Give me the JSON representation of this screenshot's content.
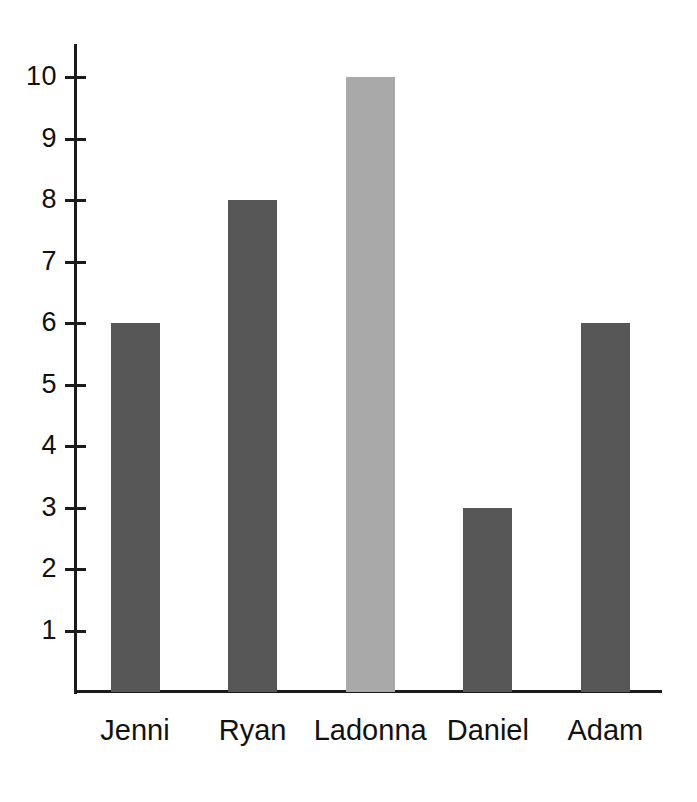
{
  "chart_data": {
    "type": "bar",
    "title": "",
    "subtitle": "",
    "xlabel": "",
    "ylabel": "",
    "categories": [
      "Jenni",
      "Ryan",
      "Ladonna",
      "Daniel",
      "Adam"
    ],
    "values": [
      6,
      8,
      10,
      3,
      6
    ],
    "series": [
      {
        "name": "",
        "values": [
          6,
          8,
          10,
          3,
          6
        ]
      }
    ],
    "bars": [
      {
        "category": "Jenni",
        "value": 6,
        "color": "#575757"
      },
      {
        "category": "Ryan",
        "value": 8,
        "color": "#575757"
      },
      {
        "category": "Ladonna",
        "value": 10,
        "color": "#a9a9a9"
      },
      {
        "category": "Daniel",
        "value": 3,
        "color": "#575757"
      },
      {
        "category": "Adam",
        "value": 6,
        "color": "#575757"
      }
    ],
    "ylim": [
      0,
      10.5
    ],
    "ytick_labels": [
      "10",
      "9",
      "8",
      "7",
      "6",
      "5",
      "4",
      "3",
      "2",
      "1"
    ],
    "ytick_values": [
      10,
      9,
      8,
      7,
      6,
      5,
      4,
      3,
      2,
      1
    ],
    "grid": false,
    "legend": false,
    "legend_position": "none",
    "axis_color": "#1b1b1b",
    "text_color": "#111111",
    "background_color": "#ffffff",
    "bar_color_default": "#575757",
    "bar_color_highlight": "#a9a9a9"
  }
}
